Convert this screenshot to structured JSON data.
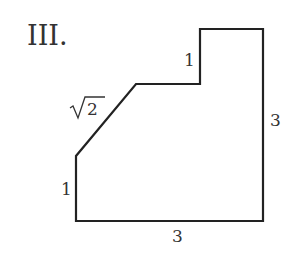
{
  "figure": {
    "label": "III.",
    "shape": {
      "type": "polygon",
      "stroke": "#222222",
      "points": [
        [
          76,
          221
        ],
        [
          76,
          156
        ],
        [
          136,
          84
        ],
        [
          200,
          84
        ],
        [
          200,
          29
        ],
        [
          263,
          29
        ],
        [
          263,
          221
        ]
      ]
    },
    "edge_labels": {
      "left_vertical": "1",
      "diagonal": "2",
      "diagonal_prefix": "√",
      "step_vertical": "1",
      "right_vertical": "3",
      "bottom": "3"
    }
  }
}
